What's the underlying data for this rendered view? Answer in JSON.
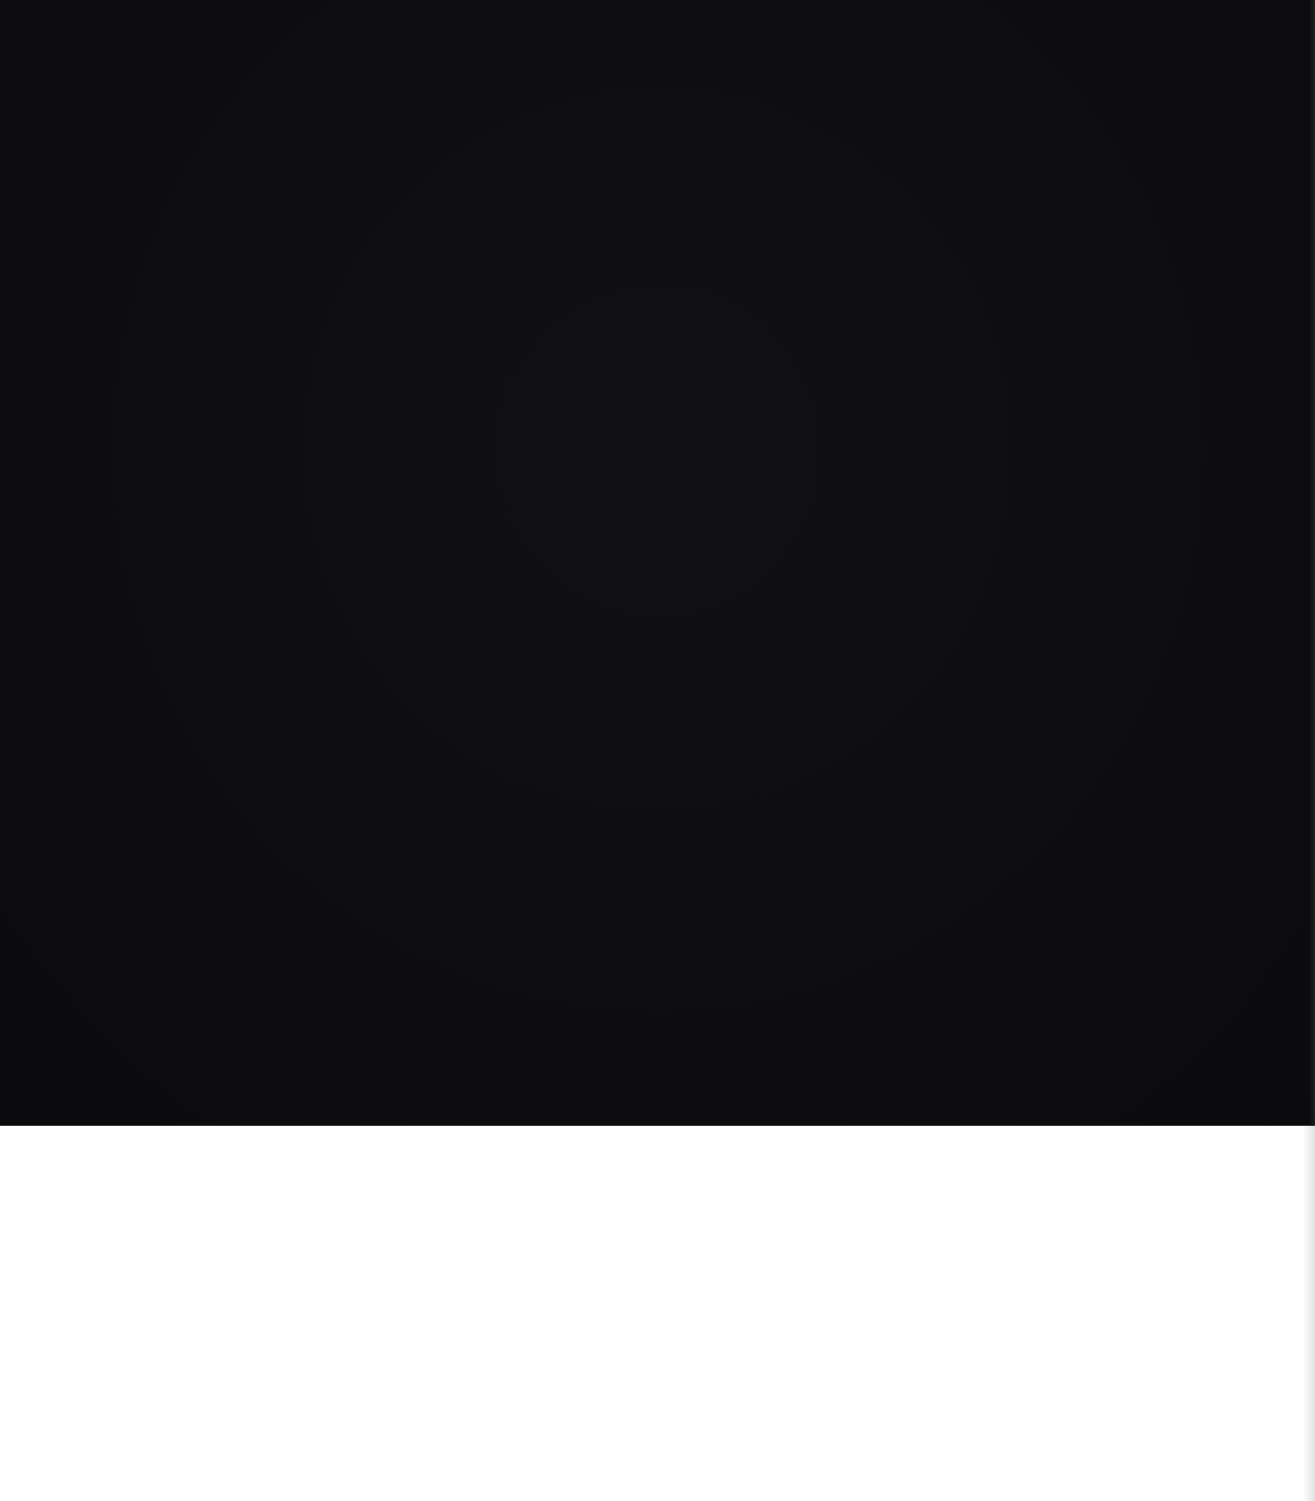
{
  "page": {
    "regions": [
      {
        "name": "black-block",
        "color": "#0e0e10"
      },
      {
        "name": "white-strip",
        "color": "#ffffff"
      }
    ]
  }
}
